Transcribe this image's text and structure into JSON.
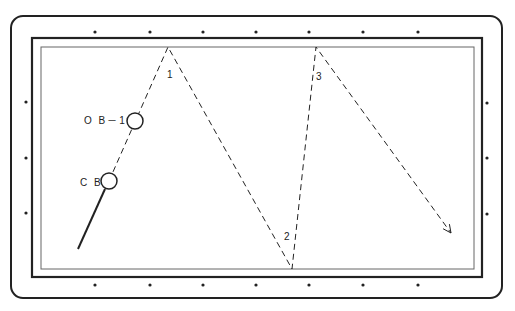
{
  "diagram": {
    "type": "billiards-shot-diagram",
    "colors": {
      "background": "#ffffff",
      "ink": "#222222",
      "cushion": "#555555"
    },
    "labels": {
      "cue_ball": "C B",
      "object_ball": "O B－1",
      "bank_1": "1",
      "bank_2": "2",
      "bank_3": "3"
    },
    "table": {
      "outer_frame": {
        "x": 11,
        "y": 16,
        "w": 491,
        "h": 282,
        "r": 12
      },
      "rail": {
        "x": 32,
        "y": 38,
        "w": 450,
        "h": 239
      },
      "cushion": {
        "x": 41,
        "y": 47,
        "w": 433,
        "h": 222
      }
    },
    "diamonds": {
      "top": [
        [
          95,
          32
        ],
        [
          150,
          32
        ],
        [
          203,
          32
        ],
        [
          256,
          32
        ],
        [
          309,
          32
        ],
        [
          363,
          32
        ],
        [
          418,
          32
        ]
      ],
      "bottom": [
        [
          95,
          285
        ],
        [
          150,
          285
        ],
        [
          203,
          285
        ],
        [
          256,
          285
        ],
        [
          309,
          285
        ],
        [
          363,
          285
        ],
        [
          418,
          285
        ]
      ],
      "left": [
        [
          26,
          102
        ],
        [
          26,
          158
        ],
        [
          26,
          213
        ]
      ],
      "right": [
        [
          487,
          103
        ],
        [
          487,
          158
        ],
        [
          487,
          214
        ]
      ]
    },
    "balls": {
      "cue_ball": {
        "cx": 109,
        "cy": 181,
        "r": 8
      },
      "object_ball": {
        "cx": 135,
        "cy": 121,
        "r": 8
      }
    },
    "cue_stick": {
      "x1": 78,
      "y1": 249,
      "x2": 105,
      "y2": 189
    },
    "path_points": [
      [
        109,
        181
      ],
      [
        168,
        47
      ],
      [
        292,
        269
      ],
      [
        316,
        47
      ],
      [
        451,
        233
      ]
    ]
  }
}
